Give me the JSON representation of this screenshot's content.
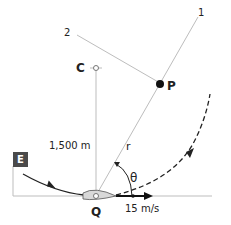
{
  "diagram": {
    "points": {
      "C": {
        "label": "C"
      },
      "P": {
        "label": "P"
      },
      "Q": {
        "label": "Q"
      }
    },
    "lines": {
      "line1_label": "1",
      "line2_label": "2"
    },
    "distance_label": "1,500 m",
    "radius_label": "r",
    "angle_label": "θ",
    "velocity_label": "15 m/s",
    "compass_label": "E",
    "colors": {
      "line": "#b8b8b8",
      "path": "#222222",
      "boat_fill": "#d8d8d8",
      "compass_box": "#4a4a4a"
    }
  }
}
